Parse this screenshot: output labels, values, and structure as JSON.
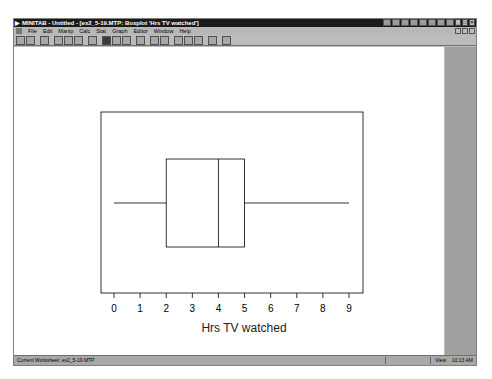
{
  "window": {
    "title": "MINITAB - Untitled - [ex2_5-19.MTP: Boxplot 'Hrs TV watched']",
    "app_icon": "minitab-icon",
    "window_controls": [
      "minimize",
      "restore",
      "close"
    ]
  },
  "menubar": {
    "items": [
      "File",
      "Edit",
      "Manip",
      "Calc",
      "Stat",
      "Graph",
      "Editor",
      "Window",
      "Help"
    ]
  },
  "toolbar": {
    "buttons": [
      "open",
      "save",
      "print",
      "cut",
      "copy",
      "paste",
      "undo",
      "edit-last-dialog",
      "brush",
      "select",
      "graph",
      "session",
      "worksheet",
      "info",
      "history",
      "manage",
      "cancel",
      "help"
    ]
  },
  "statusbar": {
    "left": "Current Worksheet: ex2_5-19.MTP",
    "mode": "View",
    "time": "10:13 AM"
  },
  "chart_data": {
    "type": "boxplot",
    "orientation": "horizontal",
    "title": "",
    "xlabel": "Hrs TV watched",
    "ylabel": "",
    "xlim": [
      0,
      9
    ],
    "x_ticks": [
      0,
      1,
      2,
      3,
      4,
      5,
      6,
      7,
      8,
      9
    ],
    "grid": false,
    "legend": false,
    "series": [
      {
        "name": "Hrs TV watched",
        "min": 0,
        "q1": 2,
        "median": 4,
        "q3": 5,
        "max": 9
      }
    ]
  }
}
